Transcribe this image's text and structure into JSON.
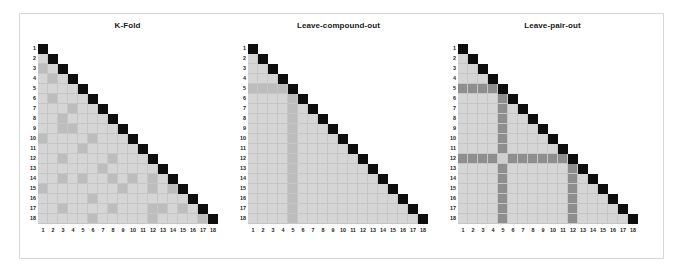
{
  "figure": {
    "background_color": "#ffffff",
    "frame_color": "#d8d8d8",
    "width": 678,
    "height": 271
  },
  "colors": {
    "diagonal": "#0d0d0d",
    "base": "#d5d5d5",
    "mid": "#bdbdbd",
    "dark": "#8e8e8e",
    "light_intersection": "#cfcfcf",
    "gridline": "#c6c6c6",
    "label": "#222222",
    "title": "#1a1a1a"
  },
  "chart_data": {
    "type": "heatmap",
    "xlabel": "",
    "ylabel": "",
    "categories": [
      "1",
      "2",
      "3",
      "4",
      "5",
      "6",
      "7",
      "8",
      "9",
      "10",
      "11",
      "12",
      "13",
      "14",
      "15",
      "16",
      "17",
      "18"
    ],
    "tick_labels_x": [
      "1",
      "2",
      "3",
      "4",
      "5",
      "6",
      "7",
      "8",
      "9",
      "10",
      "11",
      "12",
      "13",
      "14",
      "15",
      "16",
      "17",
      "18"
    ],
    "tick_labels_y": [
      "1",
      "2",
      "3",
      "4",
      "5",
      "6",
      "7",
      "8",
      "9",
      "10",
      "11",
      "12",
      "13",
      "14",
      "15",
      "16",
      "17",
      "18"
    ],
    "n": 18,
    "grid": true,
    "legend": "none",
    "shape": "lower-triangular",
    "value_levels": {
      "diagonal": 3,
      "held_out": 2,
      "train": 1,
      "empty": 0
    },
    "panels": [
      {
        "name": "k-fold",
        "title": "K-Fold",
        "description": "Randomly scattered held-out pairs across the lower triangle",
        "held_out_cells": [
          [
            3,
            1
          ],
          [
            4,
            2
          ],
          [
            6,
            2
          ],
          [
            7,
            4
          ],
          [
            8,
            3
          ],
          [
            9,
            3
          ],
          [
            9,
            4
          ],
          [
            10,
            1
          ],
          [
            10,
            6
          ],
          [
            10,
            10
          ],
          [
            11,
            5
          ],
          [
            12,
            3
          ],
          [
            12,
            8
          ],
          [
            13,
            7
          ],
          [
            13,
            13
          ],
          [
            14,
            3
          ],
          [
            14,
            5
          ],
          [
            14,
            8
          ],
          [
            14,
            10
          ],
          [
            14,
            12
          ],
          [
            15,
            1
          ],
          [
            15,
            9
          ],
          [
            15,
            12
          ],
          [
            15,
            14
          ],
          [
            16,
            6
          ],
          [
            17,
            3
          ],
          [
            17,
            8
          ],
          [
            17,
            12
          ],
          [
            17,
            13
          ],
          [
            17,
            15
          ],
          [
            18,
            6
          ],
          [
            18,
            12
          ],
          [
            18,
            17
          ]
        ]
      },
      {
        "name": "leave-compound-out",
        "title": "Leave-compound-out",
        "description": "All pairs involving compound 5 are held out: row 5 and column 5",
        "held_out_row": 5,
        "held_out_col": 5
      },
      {
        "name": "leave-pair-out",
        "title": "Leave-pair-out",
        "description": "All pairs involving compounds 5 and 12 are held out; their intersection cell is lighter",
        "held_out_rows": [
          5,
          12
        ],
        "held_out_cols": [
          5,
          12
        ],
        "intersection_cell": [
          12,
          5
        ]
      }
    ]
  },
  "panels_layout": [
    {
      "key": "k-fold",
      "left": 20,
      "width": 215,
      "grid_left": 38,
      "grid_top": 44,
      "cell": 10.0,
      "label_gap": 2
    },
    {
      "key": "leave-compound-out",
      "left": 232,
      "width": 213,
      "grid_left": 248,
      "grid_top": 44,
      "cell": 10.0,
      "label_gap": 2
    },
    {
      "key": "leave-pair-out",
      "left": 444,
      "width": 217,
      "grid_left": 458,
      "grid_top": 44,
      "cell": 10.0,
      "label_gap": 2
    }
  ]
}
